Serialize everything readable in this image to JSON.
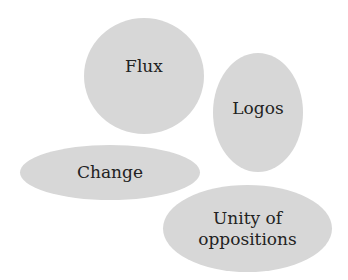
{
  "diagram": {
    "type": "bubble-cluster",
    "fill_color": "#d7d7d7",
    "text_color": "#222222",
    "nodes": [
      {
        "id": "flux",
        "label": "Flux",
        "x": 84,
        "y": 18,
        "w": 120,
        "h": 116,
        "label_dy": -10
      },
      {
        "id": "logos",
        "label": "Logos",
        "x": 213,
        "y": 53,
        "w": 90,
        "h": 119,
        "label_dy": -4
      },
      {
        "id": "change",
        "label": "Change",
        "x": 20,
        "y": 145,
        "w": 180,
        "h": 55,
        "label_dy": 0
      },
      {
        "id": "unity",
        "label": "Unity of\noppositions",
        "x": 163,
        "y": 185,
        "w": 169,
        "h": 87,
        "label_dy": 0
      }
    ]
  }
}
